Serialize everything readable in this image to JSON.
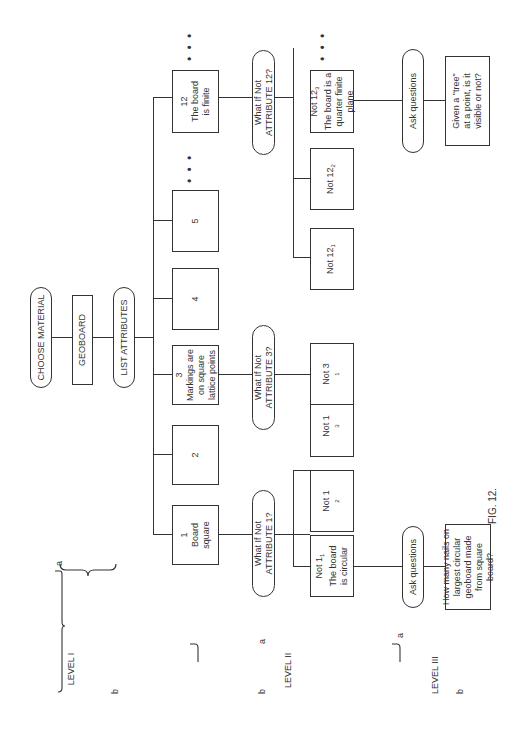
{
  "figure": {
    "caption": "FIG. 12.",
    "orientation": "rotated 90° counter-clockwise"
  },
  "top": {
    "choose_material": "CHOOSE MATERIAL",
    "geoboard": "GEOBOARD",
    "list_attributes": "LIST ATTRIBUTES"
  },
  "levels": {
    "level1": {
      "label": "LEVEL I",
      "a": "a",
      "b": "b"
    },
    "level2": {
      "label": "LEVEL II",
      "a": "a",
      "b": "b"
    },
    "level3": {
      "label": "LEVEL III",
      "a": "a",
      "b": "b"
    }
  },
  "attributes": [
    {
      "num": "1",
      "text": "Board square"
    },
    {
      "num": "2",
      "text": ""
    },
    {
      "num": "3",
      "text": "Markings are on square lattice points"
    },
    {
      "num": "4",
      "text": ""
    },
    {
      "num": "5",
      "text": ""
    },
    {
      "num": "12",
      "text": "The board is finite"
    }
  ],
  "ellipsis": "• • •",
  "what_if": {
    "a1": {
      "line1": "What If Not",
      "line2": "ATTRIBUTE 1?"
    },
    "a3": {
      "line1": "What If Not",
      "line2": "ATTRIBUTE 3?"
    },
    "a12": {
      "line1": "What If Not",
      "line2": "ATTRIBUTE 12?"
    }
  },
  "negations": {
    "n1_1": {
      "main": "Not 1",
      "sub": "1",
      "text": "The board is circular"
    },
    "n1_2": {
      "main": "Not 1",
      "sub": "2"
    },
    "n1_3": {
      "main": "Not 1",
      "sub": "3"
    },
    "n3_1": {
      "main": "Not 3",
      "sub": "1"
    },
    "n12_1": {
      "main": "Not 12",
      "sub": "1"
    },
    "n12_2": {
      "main": "Not 12",
      "sub": "2"
    },
    "n12_3": {
      "main": "Not 12",
      "sub": "3",
      "text": "The board is a quarter finite plane"
    }
  },
  "ask": {
    "q1": "Ask questions",
    "q12": "Ask questions"
  },
  "questions": {
    "q1": "How many nails on largest circular geoboard made from square board?",
    "q12": "Given a \"tree\" at a point, is it visible or not?"
  }
}
